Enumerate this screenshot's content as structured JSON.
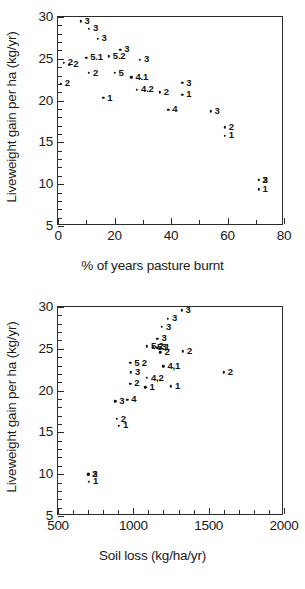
{
  "figure": {
    "panels": [
      "top",
      "bottom"
    ]
  },
  "chart_data": [
    {
      "type": "scatter",
      "panel": "top",
      "title": "",
      "xlabel": "% of years pasture burnt",
      "ylabel": "Liveweight gain per ha (kg/yr)",
      "xlim": [
        0,
        80
      ],
      "ylim": [
        5,
        30
      ],
      "xticks": [
        0,
        20,
        40,
        60,
        80
      ],
      "xtick_labels": [
        "0",
        "20",
        "40",
        "60",
        "80"
      ],
      "xminor_step": 10,
      "yticks": [
        5,
        10,
        15,
        20,
        25,
        30
      ],
      "ytick_labels": [
        "5",
        "10",
        "15",
        "20",
        "25",
        "30"
      ],
      "yminor_step": 1,
      "grid": false,
      "legend": "none",
      "point_label_field": "label",
      "points": [
        {
          "x": 8,
          "y": 29.5,
          "label": "3"
        },
        {
          "x": 11,
          "y": 28.6,
          "label": "3"
        },
        {
          "x": 14,
          "y": 27.4,
          "label": "3"
        },
        {
          "x": 22,
          "y": 26.1,
          "label": "3"
        },
        {
          "x": 10,
          "y": 25.1,
          "label": "5.1"
        },
        {
          "x": 18,
          "y": 25.3,
          "label": "5.2"
        },
        {
          "x": 29,
          "y": 24.9,
          "label": "3"
        },
        {
          "x": 2,
          "y": 24.5,
          "label": "2"
        },
        {
          "x": 4,
          "y": 24.3,
          "label": "2"
        },
        {
          "x": 11,
          "y": 23.3,
          "label": "2"
        },
        {
          "x": 20,
          "y": 23.3,
          "label": "5"
        },
        {
          "x": 26,
          "y": 22.8,
          "label": "4.1"
        },
        {
          "x": 44,
          "y": 22.1,
          "label": "3"
        },
        {
          "x": 1,
          "y": 22.0,
          "label": "2"
        },
        {
          "x": 28,
          "y": 21.3,
          "label": "4.2"
        },
        {
          "x": 36,
          "y": 21.0,
          "label": "2"
        },
        {
          "x": 44,
          "y": 20.7,
          "label": "1"
        },
        {
          "x": 16,
          "y": 20.3,
          "label": "1"
        },
        {
          "x": 39,
          "y": 18.9,
          "label": "4"
        },
        {
          "x": 54,
          "y": 18.7,
          "label": "3"
        },
        {
          "x": 59,
          "y": 16.8,
          "label": "2"
        },
        {
          "x": 59,
          "y": 15.8,
          "label": "1"
        },
        {
          "x": 71,
          "y": 10.5,
          "label": "2"
        },
        {
          "x": 71,
          "y": 10.5,
          "label": "3"
        },
        {
          "x": 71,
          "y": 9.4,
          "label": "1"
        }
      ]
    },
    {
      "type": "scatter",
      "panel": "bottom",
      "title": "",
      "xlabel": "Soil loss (kg/ha/yr)",
      "ylabel": "Liveweight gain per ha (kg/yr)",
      "xlim": [
        500,
        2000
      ],
      "ylim": [
        5,
        30
      ],
      "xticks": [
        500,
        1000,
        1500,
        2000
      ],
      "xtick_labels": [
        "500",
        "1000",
        "1500",
        "2000"
      ],
      "xminor_step": 100,
      "yticks": [
        5,
        10,
        15,
        20,
        25,
        30
      ],
      "ytick_labels": [
        "5",
        "10",
        "15",
        "20",
        "25",
        "30"
      ],
      "yminor_step": 1,
      "grid": false,
      "legend": "none",
      "point_label_field": "label",
      "points": [
        {
          "x": 1320,
          "y": 29.6,
          "label": "3"
        },
        {
          "x": 1230,
          "y": 28.6,
          "label": "3"
        },
        {
          "x": 1190,
          "y": 27.6,
          "label": "3"
        },
        {
          "x": 1160,
          "y": 26.2,
          "label": "3"
        },
        {
          "x": 1090,
          "y": 25.3,
          "label": "5.2"
        },
        {
          "x": 1130,
          "y": 25.2,
          "label": "5.1"
        },
        {
          "x": 1160,
          "y": 25.1,
          "label": "3"
        },
        {
          "x": 1180,
          "y": 24.6,
          "label": "2"
        },
        {
          "x": 1330,
          "y": 24.7,
          "label": "2"
        },
        {
          "x": 980,
          "y": 23.3,
          "label": "5 2"
        },
        {
          "x": 1200,
          "y": 22.9,
          "label": "4,1"
        },
        {
          "x": 985,
          "y": 22.2,
          "label": "3"
        },
        {
          "x": 1600,
          "y": 22.2,
          "label": "2"
        },
        {
          "x": 1090,
          "y": 21.5,
          "label": "4,2"
        },
        {
          "x": 980,
          "y": 20.8,
          "label": "2"
        },
        {
          "x": 1080,
          "y": 20.4,
          "label": "1"
        },
        {
          "x": 1250,
          "y": 20.5,
          "label": "1"
        },
        {
          "x": 880,
          "y": 18.7,
          "label": "3"
        },
        {
          "x": 960,
          "y": 18.9,
          "label": "4"
        },
        {
          "x": 890,
          "y": 16.6,
          "label": "2"
        },
        {
          "x": 905,
          "y": 15.8,
          "label": "1"
        },
        {
          "x": 700,
          "y": 10.0,
          "label": "2"
        },
        {
          "x": 700,
          "y": 10.0,
          "label": "3"
        },
        {
          "x": 705,
          "y": 9.1,
          "label": "1"
        }
      ]
    }
  ]
}
